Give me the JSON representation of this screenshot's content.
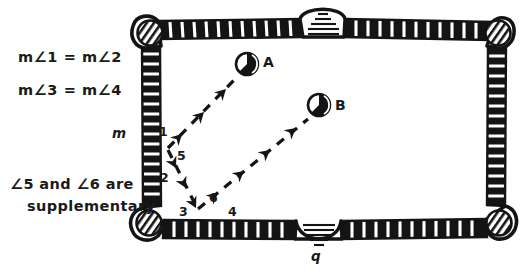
{
  "figure": {
    "background_color": "#ffffff",
    "ink_color": "#141414"
  },
  "statements": {
    "line1": "m∠1 = m∠2",
    "line2": "m∠3 = m∠4",
    "line3": "∠5 and ∠6 are",
    "line4": "supplementary"
  },
  "line_labels": {
    "left_rail": "m",
    "bottom_rail": "q"
  },
  "balls": [
    {
      "id": "A",
      "label": "A",
      "cx": 247,
      "cy": 64,
      "r": 11
    },
    {
      "id": "B",
      "label": "B",
      "cx": 319,
      "cy": 105,
      "r": 11
    }
  ],
  "angles": [
    {
      "label": "1",
      "x": 161,
      "y": 134
    },
    {
      "label": "5",
      "x": 180,
      "y": 158
    },
    {
      "label": "2",
      "x": 163,
      "y": 181
    },
    {
      "label": "3",
      "x": 182,
      "y": 214
    },
    {
      "label": "6",
      "x": 212,
      "y": 200
    },
    {
      "label": "4",
      "x": 231,
      "y": 214
    }
  ],
  "table": {
    "rail_color": "#141414",
    "cloth_color": "#ffffff",
    "left": 136,
    "top": 16,
    "right": 512,
    "bottom": 238,
    "pockets": [
      {
        "name": "top-left-pocket",
        "kind": "corner",
        "cx": 152,
        "cy": 36
      },
      {
        "name": "top-middle-pocket",
        "kind": "side",
        "cx": 323,
        "cy": 22
      },
      {
        "name": "top-right-pocket",
        "kind": "corner",
        "cx": 496,
        "cy": 36
      },
      {
        "name": "bottom-left-pocket",
        "kind": "corner",
        "cx": 152,
        "cy": 216
      },
      {
        "name": "bottom-middle-pocket",
        "kind": "side",
        "cx": 318,
        "cy": 232
      },
      {
        "name": "bottom-right-pocket",
        "kind": "corner",
        "cx": 496,
        "cy": 216
      }
    ]
  },
  "shot_path": {
    "description": "Dashed arrow path bouncing off the left rail and the bottom rail",
    "vertices": [
      {
        "x": 236,
        "y": 76
      },
      {
        "x": 168,
        "y": 148
      },
      {
        "x": 196,
        "y": 207
      },
      {
        "x": 308,
        "y": 117
      }
    ]
  }
}
